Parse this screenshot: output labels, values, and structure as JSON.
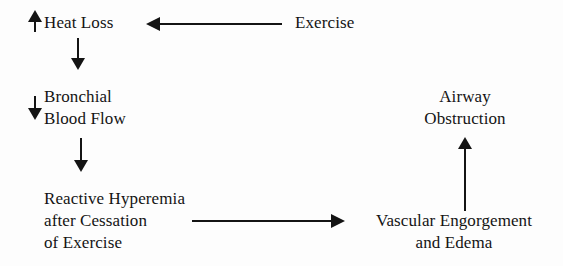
{
  "diagram": {
    "type": "flowchart",
    "background_color": "#fdfdfd",
    "ink_color": "#141414",
    "nodes": [
      {
        "id": "heat-loss",
        "label": "Heat Loss",
        "marker": "up-arrow",
        "marker_meaning": "increase"
      },
      {
        "id": "bronchial-blood-flow",
        "label": "Bronchial\nBlood Flow",
        "marker": "down-arrow",
        "marker_meaning": "decrease"
      },
      {
        "id": "reactive-hyperemia",
        "label": "Reactive Hyperemia\nafter Cessation\nof Exercise",
        "marker": "none",
        "marker_meaning": ""
      },
      {
        "id": "exercise",
        "label": "Exercise",
        "marker": "none",
        "marker_meaning": ""
      },
      {
        "id": "vascular-engorgement",
        "label": "Vascular Engorgement\nand Edema",
        "marker": "none",
        "marker_meaning": ""
      },
      {
        "id": "airway-obstruction",
        "label": "Airway\nObstruction",
        "marker": "none",
        "marker_meaning": ""
      }
    ],
    "edges": [
      {
        "id": "exercise-to-heat-loss",
        "from": "exercise",
        "to": "heat-loss",
        "direction": "left"
      },
      {
        "id": "heat-loss-to-bronchial",
        "from": "heat-loss",
        "to": "bronchial-blood-flow",
        "direction": "down"
      },
      {
        "id": "bronchial-to-hyperemia",
        "from": "bronchial-blood-flow",
        "to": "reactive-hyperemia",
        "direction": "down"
      },
      {
        "id": "hyperemia-to-vascular",
        "from": "reactive-hyperemia",
        "to": "vascular-engorgement",
        "direction": "right"
      },
      {
        "id": "vascular-to-obstruction",
        "from": "vascular-engorgement",
        "to": "airway-obstruction",
        "direction": "up"
      }
    ]
  }
}
